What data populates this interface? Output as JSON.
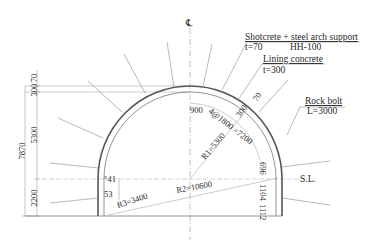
{
  "drawing": {
    "title": "Tunnel cross-section",
    "centerline_symbol": "℄",
    "springline_label": "S.L.",
    "callouts": {
      "shotcrete": {
        "title": "Shotcrete + steel arch support",
        "thickness": "t=70",
        "steel": "HH-100"
      },
      "lining": {
        "title": "Lining concrete",
        "thickness": "t=300"
      },
      "rockbolt": {
        "title": "Rock bolt",
        "length": "L=3000"
      }
    },
    "left_dimensions": {
      "top_70": "70",
      "d300": "300",
      "d5300": "5300",
      "total": "7870",
      "d2200": "2200"
    },
    "arch_dimensions": {
      "d900": "900",
      "spacing": "4@1800 =7200",
      "d300": "300",
      "d70": "70",
      "R1": "R1=5300",
      "R2": "R2=10600",
      "R3": "R3=3400",
      "right_696": "696",
      "right_1104": "1104",
      "right_1112": "1112",
      "left_angle_41": "°41",
      "left_angle_53": "53"
    },
    "colors": {
      "line": "#555555",
      "thin": "#888888",
      "text": "#2a2a2a",
      "background": "#ffffff"
    }
  }
}
